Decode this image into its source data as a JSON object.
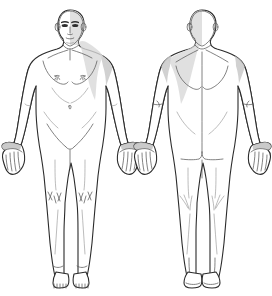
{
  "diagram": {
    "background_color": "#ffffff",
    "outline_color": "#2b2b2b",
    "detail_line_color": "#5a5a5a",
    "shading_color": "#c9c9c9",
    "feature_color": "#2e2e2e",
    "width": 272,
    "height": 296,
    "figures": [
      {
        "id": "anterior",
        "view_label": "Front view",
        "side": "left",
        "shaded_side": "figure-left",
        "regions": [
          {
            "name": "head",
            "label": "Head"
          },
          {
            "name": "face",
            "label": "Face"
          },
          {
            "name": "neck",
            "label": "Neck"
          },
          {
            "name": "chest",
            "label": "Chest"
          },
          {
            "name": "abdomen",
            "label": "Abdomen"
          },
          {
            "name": "left-arm",
            "label": "Left arm"
          },
          {
            "name": "right-arm",
            "label": "Right arm"
          },
          {
            "name": "left-hand",
            "label": "Left hand"
          },
          {
            "name": "right-hand",
            "label": "Right hand"
          },
          {
            "name": "pelvis",
            "label": "Pelvis"
          },
          {
            "name": "left-leg",
            "label": "Left leg"
          },
          {
            "name": "right-leg",
            "label": "Right leg"
          },
          {
            "name": "left-knee",
            "label": "Left knee"
          },
          {
            "name": "right-knee",
            "label": "Right knee"
          },
          {
            "name": "left-foot",
            "label": "Left foot"
          },
          {
            "name": "right-foot",
            "label": "Right foot"
          }
        ]
      },
      {
        "id": "posterior",
        "view_label": "Back view",
        "side": "right",
        "shaded_side": "figure-left",
        "regions": [
          {
            "name": "head",
            "label": "Head"
          },
          {
            "name": "neck",
            "label": "Neck"
          },
          {
            "name": "upper-back",
            "label": "Upper back"
          },
          {
            "name": "lower-back",
            "label": "Lower back"
          },
          {
            "name": "left-arm",
            "label": "Left arm"
          },
          {
            "name": "right-arm",
            "label": "Right arm"
          },
          {
            "name": "left-hand",
            "label": "Left hand"
          },
          {
            "name": "right-hand",
            "label": "Right hand"
          },
          {
            "name": "buttocks",
            "label": "Buttocks"
          },
          {
            "name": "left-leg",
            "label": "Left leg"
          },
          {
            "name": "right-leg",
            "label": "Right leg"
          },
          {
            "name": "left-knee",
            "label": "Left knee"
          },
          {
            "name": "right-knee",
            "label": "Right knee"
          },
          {
            "name": "left-foot",
            "label": "Left foot"
          },
          {
            "name": "right-foot",
            "label": "Right foot"
          }
        ]
      }
    ]
  }
}
